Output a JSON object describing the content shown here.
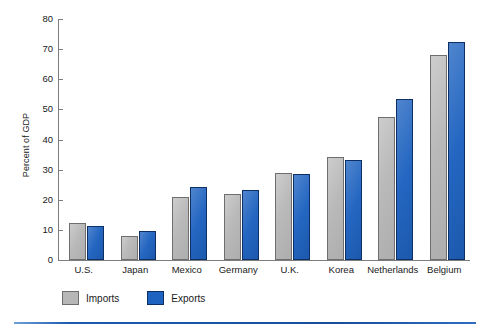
{
  "chart_data": {
    "type": "bar",
    "title": "",
    "xlabel": "",
    "ylabel": "Percent of GDP",
    "ylim": [
      0,
      80
    ],
    "yticks": [
      0,
      10,
      20,
      30,
      40,
      50,
      60,
      70,
      80
    ],
    "grid": false,
    "legend_position": "bottom-left",
    "categories": [
      "U.S.",
      "Japan",
      "Mexico",
      "Germany",
      "U.K.",
      "Korea",
      "Netherlands",
      "Belgium"
    ],
    "series": [
      {
        "name": "Imports",
        "color": "#b7b7b7",
        "values": [
          12.2,
          8.0,
          21.0,
          22.0,
          29.0,
          34.3,
          47.5,
          68.0
        ]
      },
      {
        "name": "Exports",
        "color": "#1f63c0",
        "values": [
          11.3,
          9.6,
          24.1,
          23.2,
          28.4,
          33.3,
          53.3,
          72.5
        ]
      }
    ]
  },
  "axis": {
    "tick_labels": [
      "0",
      "10",
      "20",
      "30",
      "40",
      "50",
      "60",
      "70",
      "80"
    ],
    "y_title": "Percent of GDP"
  },
  "categories": {
    "c0": "U.S.",
    "c1": "Japan",
    "c2": "Mexico",
    "c3": "Germany",
    "c4": "U.K.",
    "c5": "Korea",
    "c6": "Netherlands",
    "c7": "Belgium"
  },
  "legend": {
    "imports_label": "Imports",
    "exports_label": "Exports"
  },
  "colors": {
    "imports": "#b7b7b7",
    "imports_border": "#6e6e6e",
    "exports": "#1f63c0",
    "exports_border": "#0d2f63",
    "axis": "#7d7d7d",
    "rule": "#1a5bb0"
  }
}
